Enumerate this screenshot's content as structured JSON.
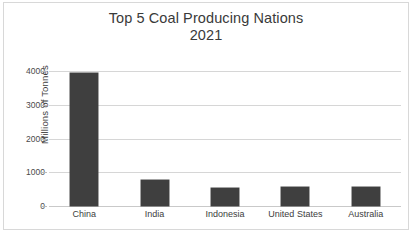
{
  "chart_data": {
    "type": "bar",
    "title": "Top 5 Coal Producing Nations",
    "subtitle": "2021",
    "xlabel": "",
    "ylabel": "Millions of Tonnes",
    "categories": [
      "China",
      "India",
      "Indonesia",
      "United States",
      "Australia"
    ],
    "values": [
      3950,
      760,
      545,
      555,
      560
    ],
    "yticks": [
      "0",
      "1000",
      "2000",
      "3000",
      "4000"
    ],
    "ytick_values": [
      0,
      1000,
      2000,
      3000,
      4000
    ],
    "ylim": [
      0,
      4000
    ],
    "grid": true,
    "legend": "none",
    "bar_color": "#3f3f3f",
    "gridline_color": "#d6d6d6",
    "background": "#ffffff",
    "border_color": "#d8d8d8",
    "title_color": "#3a3a3a"
  },
  "caption_bleed": "partial line of scanned page text"
}
